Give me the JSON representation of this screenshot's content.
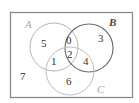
{
  "diagram": {
    "type": "venn",
    "sets": [
      {
        "name": "A",
        "color": "#a8a8a8",
        "stroke": "#b8b8b8"
      },
      {
        "name": "B",
        "color": "#444444",
        "stroke": "#6a6a6a"
      },
      {
        "name": "C",
        "color": "#a8a8a8",
        "stroke": "#c0c0c0"
      }
    ],
    "regions": {
      "A_only": "5",
      "B_only": "3",
      "C_only": "6",
      "A_and_B_only": "0",
      "A_and_C_only": "1",
      "B_and_C_only": "4",
      "A_and_B_and_C": "2",
      "outside": "7"
    },
    "frame_color": "#8a8a8a"
  }
}
